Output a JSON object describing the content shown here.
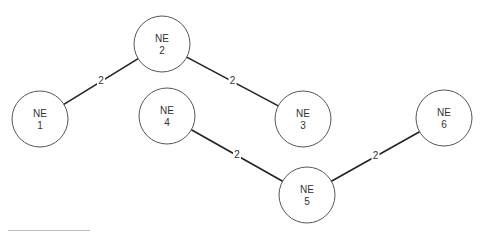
{
  "diagram": {
    "nodes": [
      {
        "id": "ne1",
        "line1": "NE",
        "line2": "1"
      },
      {
        "id": "ne2",
        "line1": "NE",
        "line2": "2"
      },
      {
        "id": "ne3",
        "line1": "NE",
        "line2": "3"
      },
      {
        "id": "ne4",
        "line1": "NE",
        "line2": "4"
      },
      {
        "id": "ne5",
        "line1": "NE",
        "line2": "5"
      },
      {
        "id": "ne6",
        "line1": "NE",
        "line2": "6"
      }
    ],
    "links": [
      {
        "from": "ne2",
        "to": "ne1",
        "label": "2"
      },
      {
        "from": "ne2",
        "to": "ne3",
        "label": "2"
      },
      {
        "from": "ne4",
        "to": "ne5",
        "label": "2"
      },
      {
        "from": "ne5",
        "to": "ne6",
        "label": "2"
      }
    ]
  }
}
